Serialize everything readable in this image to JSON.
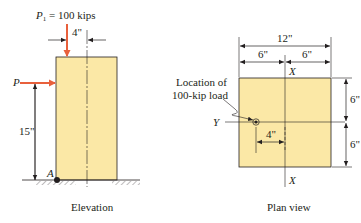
{
  "elevation": {
    "load_label_sym": "P",
    "load_label_sub": "1",
    "load_label_rest": " = 100 kips",
    "eccentricity": "4\"",
    "lateral_load_label": "P",
    "height_dim": "15\"",
    "support_label": "A",
    "caption": "Elevation"
  },
  "plan": {
    "width_total": "12\"",
    "width_left": "6\"",
    "width_right": "6\"",
    "height_top": "6\"",
    "height_bottom": "6\"",
    "x_axis_top": "X",
    "x_axis_bottom": "X",
    "y_axis": "Y",
    "load_location_line1": "Location of",
    "load_location_line2": "100-kip load",
    "load_offset": "4\"",
    "caption": "Plan view"
  },
  "colors": {
    "column_fill": "#fbe8a6",
    "arrow": "#e8603c",
    "ink": "#231f20"
  }
}
